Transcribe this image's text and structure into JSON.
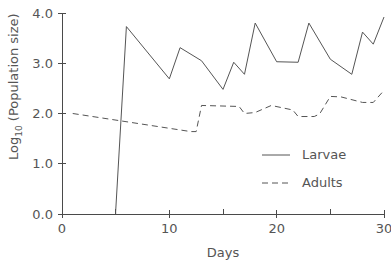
{
  "chart_data": {
    "type": "line",
    "title": "",
    "xlabel": "Days",
    "ylabel": "Log10 (Population size)",
    "ylabel_main": "Log",
    "ylabel_sub": "10",
    "ylabel_rest": " (Population size)",
    "xlim": [
      0,
      30
    ],
    "ylim": [
      0.0,
      4.0
    ],
    "xticks": [
      0,
      10,
      20,
      30
    ],
    "xtick_labels": [
      "0",
      "10",
      "20",
      "30"
    ],
    "xticks_minor": [
      5,
      15,
      25
    ],
    "yticks": [
      0.0,
      1.0,
      2.0,
      3.0,
      4.0
    ],
    "ytick_labels": [
      "0.0",
      "1.0",
      "2.0",
      "3.0",
      "4.0"
    ],
    "grid": false,
    "legend_position": "center-right",
    "series": [
      {
        "name": "Larvae",
        "style": "solid",
        "color": "#555555",
        "x": [
          5,
          5,
          6,
          10,
          11,
          13,
          15,
          16,
          17,
          18,
          20,
          22,
          23,
          25,
          27,
          28,
          29,
          30
        ],
        "values": [
          0.0,
          0.05,
          3.73,
          2.69,
          3.31,
          3.05,
          2.48,
          3.02,
          2.78,
          3.8,
          3.03,
          3.02,
          3.8,
          3.08,
          2.78,
          3.62,
          3.38,
          3.92
        ]
      },
      {
        "name": "Adults",
        "style": "dashed",
        "color": "#555555",
        "x": [
          1,
          12,
          12.5,
          13,
          16.5,
          17,
          18,
          19.5,
          21.5,
          22,
          23.5,
          24,
          25,
          26,
          28,
          29,
          30
        ],
        "values": [
          2.0,
          1.64,
          1.64,
          2.16,
          2.14,
          2.0,
          2.02,
          2.16,
          2.07,
          1.94,
          1.94,
          1.99,
          2.34,
          2.33,
          2.22,
          2.22,
          2.46
        ]
      }
    ],
    "legend_entries": [
      {
        "label": "Larvae",
        "style": "solid"
      },
      {
        "label": "Adults",
        "style": "dashed"
      }
    ]
  },
  "axes_geometry": {
    "plot_left": 62,
    "plot_right": 384,
    "plot_top": 13,
    "plot_bottom": 214
  }
}
